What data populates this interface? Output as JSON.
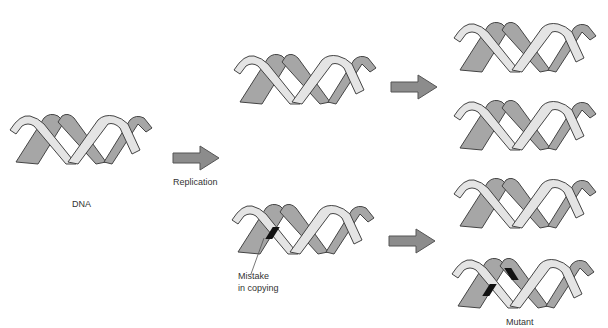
{
  "diagram": {
    "type": "mutation-replication-flow",
    "colors": {
      "strand_light": "#e4e4e4",
      "strand_dark": "#a6a6a6",
      "outline": "#444444",
      "arrow": "#8c8c8c",
      "mutation_mark": "#111111",
      "background": "#ffffff"
    },
    "labels": {
      "dna": "DNA",
      "replication": "Replication",
      "mistake_line1": "Mistake",
      "mistake_line2": "in copying",
      "mutant": "Mutant"
    },
    "nodes": [
      {
        "id": "original-dna",
        "label": "DNA",
        "mutation": false
      },
      {
        "id": "copy-normal",
        "mutation": false
      },
      {
        "id": "copy-mistake",
        "mutation": true
      },
      {
        "id": "gen2-1",
        "mutation": false
      },
      {
        "id": "gen2-2",
        "mutation": false
      },
      {
        "id": "gen2-3",
        "mutation": false
      },
      {
        "id": "gen2-4",
        "label": "Mutant",
        "mutation": true
      }
    ],
    "edges": [
      {
        "from": "original-dna",
        "to": [
          "copy-normal",
          "copy-mistake"
        ],
        "label": "Replication"
      },
      {
        "from": "copy-normal",
        "to": [
          "gen2-1",
          "gen2-2"
        ]
      },
      {
        "from": "copy-mistake",
        "to": [
          "gen2-3",
          "gen2-4"
        ]
      }
    ]
  }
}
